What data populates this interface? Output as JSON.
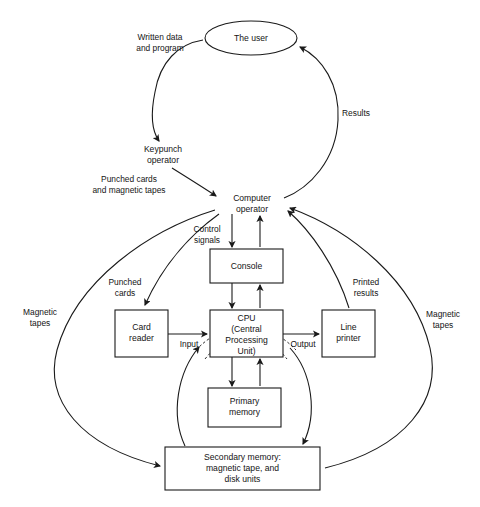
{
  "diagram": {
    "colors": {
      "stroke": "#1a1a1a",
      "background": "#ffffff",
      "text": "#141414"
    },
    "nodes": [
      {
        "id": "the-user",
        "shape": "ellipse",
        "lines": [
          "The user"
        ],
        "cx": 251,
        "cy": 38,
        "rx": 46,
        "ry": 17
      },
      {
        "id": "keypunch-operator",
        "shape": "text",
        "lines": [
          "Keypunch",
          "operator"
        ],
        "cx": 163,
        "cy": 155
      },
      {
        "id": "computer-operator",
        "shape": "text",
        "lines": [
          "Computer",
          "operator"
        ],
        "cx": 252,
        "cy": 204
      },
      {
        "id": "console",
        "shape": "rect",
        "lines": [
          "Console"
        ],
        "x": 210,
        "y": 249,
        "w": 73,
        "h": 34
      },
      {
        "id": "card-reader",
        "shape": "rect",
        "lines": [
          "Card",
          "reader"
        ],
        "x": 115,
        "y": 310,
        "w": 53,
        "h": 47
      },
      {
        "id": "cpu",
        "shape": "rect",
        "lines": [
          "CPU",
          "(Central",
          "Processing",
          "Unit)"
        ],
        "x": 210,
        "y": 310,
        "w": 73,
        "h": 47
      },
      {
        "id": "line-printer",
        "shape": "rect",
        "lines": [
          "Line",
          "printer"
        ],
        "x": 322,
        "y": 310,
        "w": 53,
        "h": 47
      },
      {
        "id": "primary-memory",
        "shape": "rect",
        "lines": [
          "Primary",
          "memory"
        ],
        "x": 208,
        "y": 388,
        "w": 73,
        "h": 39
      },
      {
        "id": "secondary-memory",
        "shape": "rect",
        "lines": [
          "Secondary memory:",
          "magnetic tape, and",
          "disk units"
        ],
        "x": 165,
        "y": 447,
        "w": 155,
        "h": 43
      }
    ],
    "edge_labels": [
      {
        "id": "written-data-and-program",
        "lines": [
          "Written data",
          "and program"
        ],
        "cx": 160,
        "cy": 43
      },
      {
        "id": "results",
        "lines": [
          "Results"
        ],
        "cx": 356,
        "cy": 114
      },
      {
        "id": "punched-cards-and-magnetic-tapes",
        "lines": [
          "Punched cards",
          "and magnetic tapes"
        ],
        "cx": 129,
        "cy": 185
      },
      {
        "id": "control-signals",
        "lines": [
          "Control",
          "signals"
        ],
        "cx": 207,
        "cy": 235
      },
      {
        "id": "punched-cards",
        "lines": [
          "Punched",
          "cards"
        ],
        "cx": 125,
        "cy": 288
      },
      {
        "id": "printed-results",
        "lines": [
          "Printed",
          "results"
        ],
        "cx": 366,
        "cy": 288
      },
      {
        "id": "magnetic-tapes-left",
        "lines": [
          "Magnetic",
          "tapes"
        ],
        "cx": 40,
        "cy": 318
      },
      {
        "id": "magnetic-tapes-right",
        "lines": [
          "Magnetic",
          "tapes"
        ],
        "cx": 443,
        "cy": 320
      },
      {
        "id": "input",
        "lines": [
          "Input"
        ],
        "cx": 189,
        "cy": 342
      },
      {
        "id": "output",
        "lines": [
          "Output"
        ],
        "cx": 303,
        "cy": 342
      }
    ]
  }
}
